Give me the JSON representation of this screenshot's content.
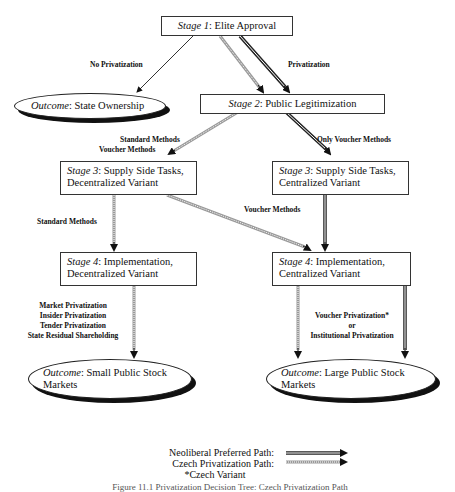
{
  "nodes": {
    "stage1": {
      "prefix": "Stage 1",
      "text": ": Elite Approval"
    },
    "outcome_state": {
      "prefix": "Outcome",
      "text": ": State Ownership"
    },
    "stage2": {
      "prefix": "Stage 2",
      "text": ": Public Legitimization"
    },
    "stage3_dec": {
      "prefix": "Stage 3",
      "text": ": Supply Side Tasks,",
      "line2": "Decentralized Variant"
    },
    "stage3_cen": {
      "prefix": "Stage 3",
      "text": ": Supply Side Tasks,",
      "line2": "Centralized Variant"
    },
    "stage4_dec": {
      "prefix": "Stage 4",
      "text": ": Implementation,",
      "line2": "Decentralized Variant"
    },
    "stage4_cen": {
      "prefix": "Stage 4",
      "text": ": Implementation,",
      "line2": "Centralized Variant"
    },
    "outcome_small": {
      "prefix": "Outcome",
      "text": ": Small Public Stock",
      "line2": "Markets"
    },
    "outcome_large": {
      "prefix": "Outcome",
      "text": ": Large Public Stock",
      "line2": "Markets"
    }
  },
  "edge_labels": {
    "no_privatization": "No Privatization",
    "privatization": "Privatization",
    "standard_voucher_1": "Standard Methods",
    "standard_voucher_2": "Voucher Methods",
    "only_voucher": "Only Voucher Methods",
    "standard_methods": "Standard Methods",
    "voucher_methods": "Voucher Methods",
    "small_methods": [
      "Market Privatization",
      "Insider Privatization",
      "Tender Privatization",
      "State Residual Shareholding"
    ],
    "large_methods": [
      "Voucher Privatization*",
      "or",
      "Institutional Privatization"
    ]
  },
  "legend": {
    "neoliberal": "Neoliberal Preferred Path:",
    "czech": "Czech Privatization Path:",
    "note": "*Czech Variant"
  },
  "caption": "Figure 11.1 Privatization Decision Tree: Czech Privatization Path"
}
